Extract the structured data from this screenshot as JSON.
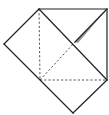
{
  "diagram": {
    "type": "origami-fold-diagram",
    "width": 109,
    "height": 115,
    "colors": {
      "background": "#ffffff",
      "stroke": "#222222",
      "dashed": "#444444",
      "shade": "#9a9a9a"
    },
    "points": {
      "top_left": [
        39,
        9
      ],
      "top_right": [
        107,
        9
      ],
      "right": [
        107,
        80
      ],
      "bottom": [
        73,
        113
      ],
      "square_bottom_left": [
        40,
        80
      ],
      "left": [
        4,
        44
      ],
      "center": [
        75,
        42
      ]
    },
    "solid_lines": [
      {
        "name": "top-edge",
        "from": "top_left",
        "to": "top_right"
      },
      {
        "name": "right-edge",
        "from": "top_right",
        "to": "right"
      },
      {
        "name": "top-left-diagonal-edge",
        "from": "top_left",
        "to": "left"
      },
      {
        "name": "left-lower-edge",
        "from": "left",
        "to": "bottom"
      },
      {
        "name": "right-lower-edge",
        "from": "right",
        "to": "bottom"
      },
      {
        "name": "inner-fold-diagonal",
        "from": "top_left",
        "to": "right"
      },
      {
        "name": "flap-crease",
        "from": "center",
        "to": "top_right"
      }
    ],
    "dashed_lines": [
      {
        "name": "vertical-valley-fold",
        "from": "top_left",
        "to": "square_bottom_left"
      },
      {
        "name": "horizontal-valley-fold",
        "from": "square_bottom_left",
        "to": "right"
      },
      {
        "name": "diagonal-valley-fold",
        "from": "square_bottom_left",
        "to": "center"
      }
    ]
  }
}
